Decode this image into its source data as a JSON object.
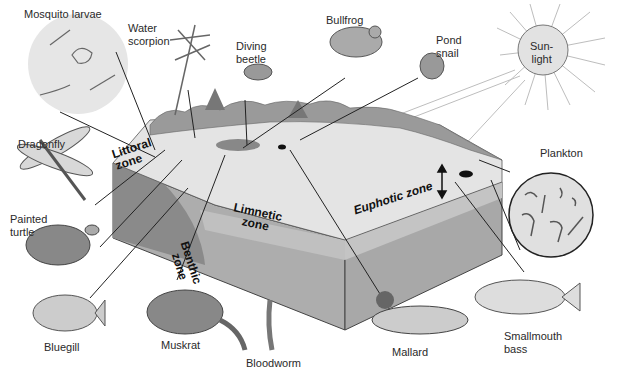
{
  "diagram": {
    "zones": {
      "littoral": "Littoral\nzone",
      "limnetic": "Limnetic\nzone",
      "benthic": "Benthic\nzone",
      "euphotic": "Euphotic zone"
    },
    "sun": {
      "label": "Sun-\nlight"
    },
    "organisms": {
      "mosquito_larvae": "Mosquito larvae",
      "water_scorpion": "Water\nscorpion",
      "diving_beetle": "Diving\nbeetle",
      "bullfrog": "Bullfrog",
      "pond_snail": "Pond\nsnail",
      "plankton": "Plankton",
      "dragonfly": "Dragonfly",
      "painted_turtle": "Painted\nturtle",
      "bluegill": "Bluegill",
      "muskrat": "Muskrat",
      "bloodworm": "Bloodworm",
      "mallard": "Mallard",
      "smallmouth_bass": "Smallmouth\nbass"
    },
    "colors": {
      "surface": "#e6e6e6",
      "front_face": "#a9a9a9",
      "right_face_upper": "#c4c4c4",
      "right_face_lower": "#a6a6a6",
      "benthic": "#8c8c8c",
      "vegetation": "#9a9a9a",
      "sun_fill": "#e2e2e2",
      "lines": "#222222"
    }
  }
}
